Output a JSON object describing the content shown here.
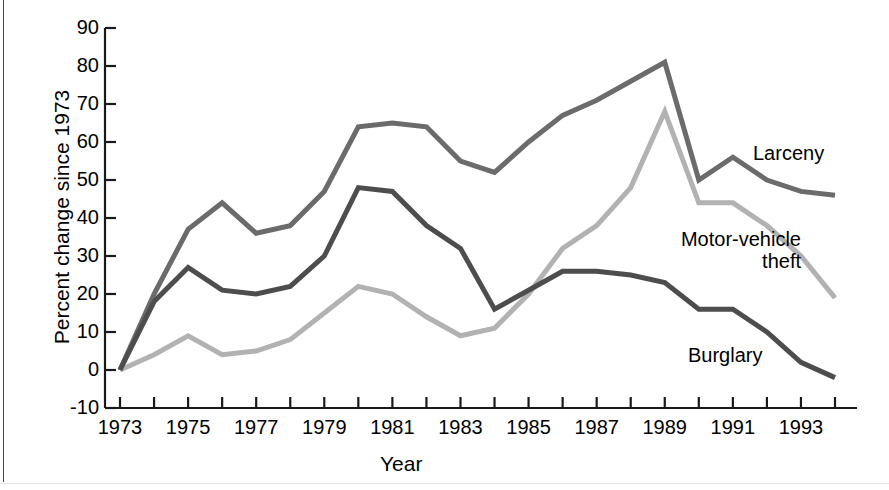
{
  "chart_data": {
    "type": "line",
    "title": "",
    "subtitle": "",
    "xlabel": "Year",
    "ylabel": "Percent change since 1973",
    "xlim": [
      1973,
      1994
    ],
    "ylim": [
      -10,
      90
    ],
    "grid": false,
    "legend_position": "inline-right-annotations",
    "y_ticks": [
      90,
      80,
      70,
      60,
      50,
      40,
      30,
      20,
      10,
      0,
      -10
    ],
    "y_tick_labels": [
      "90",
      "80",
      "70",
      "60",
      "50",
      "40",
      "30",
      "20",
      "10",
      "0",
      "-10"
    ],
    "x_ticks": [
      1973,
      1974,
      1975,
      1976,
      1977,
      1978,
      1979,
      1980,
      1981,
      1982,
      1983,
      1984,
      1985,
      1986,
      1987,
      1988,
      1989,
      1990,
      1991,
      1992,
      1993,
      1994
    ],
    "x_tick_labels": [
      "1973",
      "",
      "1975",
      "",
      "1977",
      "",
      "1979",
      "",
      "1981",
      "",
      "1983",
      "",
      "1985",
      "",
      "1987",
      "",
      "1989",
      "",
      "1991",
      "",
      "1993",
      ""
    ],
    "x_labeled_ticks": [
      "1973",
      "1975",
      "1977",
      "1979",
      "1981",
      "1983",
      "1985",
      "1987",
      "1989",
      "1991",
      "1993"
    ],
    "x": [
      1973,
      1974,
      1975,
      1976,
      1977,
      1978,
      1979,
      1980,
      1981,
      1982,
      1983,
      1984,
      1985,
      1986,
      1987,
      1988,
      1989,
      1990,
      1991,
      1992,
      1993,
      1994
    ],
    "series": [
      {
        "name": "Larceny",
        "color": "#6b6b6b",
        "values": [
          0,
          20,
          37,
          44,
          36,
          38,
          47,
          64,
          65,
          64,
          55,
          52,
          60,
          67,
          71,
          76,
          81,
          50,
          56,
          50,
          47,
          46
        ]
      },
      {
        "name": "Motor-vehicle theft",
        "color": "#b2b2b2",
        "values": [
          0,
          4,
          9,
          4,
          5,
          8,
          15,
          22,
          20,
          14,
          9,
          11,
          20,
          32,
          38,
          48,
          68,
          44,
          44,
          38,
          30,
          19
        ]
      },
      {
        "name": "Burglary",
        "color": "#4d4d4d",
        "values": [
          0,
          18,
          27,
          21,
          20,
          22,
          30,
          48,
          47,
          38,
          32,
          16,
          21,
          26,
          26,
          25,
          23,
          16,
          16,
          10,
          2,
          -2
        ]
      }
    ],
    "annotations": [
      {
        "text": "Larceny",
        "series": "Larceny"
      },
      {
        "text": "Motor-vehicle\ntheft",
        "series": "Motor-vehicle theft"
      },
      {
        "text": "Burglary",
        "series": "Burglary"
      }
    ]
  },
  "labels": {
    "larceny": "Larceny",
    "mvtheft_line1": "Motor-vehicle",
    "mvtheft_line2": "theft",
    "burglary": "Burglary"
  },
  "colors": {
    "axis": "#1a1a1a",
    "text": "#000000",
    "background": "#ffffff",
    "frame_rule": "#4a4a4a"
  }
}
